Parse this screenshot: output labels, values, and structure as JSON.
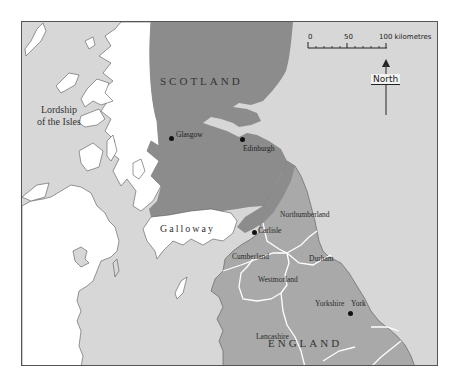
{
  "map": {
    "regions": {
      "scotland": "SCOTLAND",
      "england": "ENGLAND",
      "galloway": "Galloway",
      "lordship_line1": "Lordship",
      "lordship_line2": "of the Isles"
    },
    "cities": [
      {
        "name": "Glasgow"
      },
      {
        "name": "Edinburgh"
      },
      {
        "name": "Carlisle"
      },
      {
        "name": "York"
      }
    ],
    "counties": [
      {
        "name": "Northumberland"
      },
      {
        "name": "Cumberland"
      },
      {
        "name": "Durham"
      },
      {
        "name": "Westmorland"
      },
      {
        "name": "Yorkshire"
      },
      {
        "name": "Lancashire"
      }
    ],
    "scale_bar": {
      "tick_0": "0",
      "tick_50": "50",
      "tick_100": "100 kilometres"
    },
    "north_arrow": {
      "label": "North"
    },
    "colors": {
      "sea": "#d7d7d7",
      "scotland": "#8c8c8c",
      "england": "#a9a9a9",
      "unaffiliated_land": "#ffffff",
      "boundaries": "#ffffff"
    }
  }
}
